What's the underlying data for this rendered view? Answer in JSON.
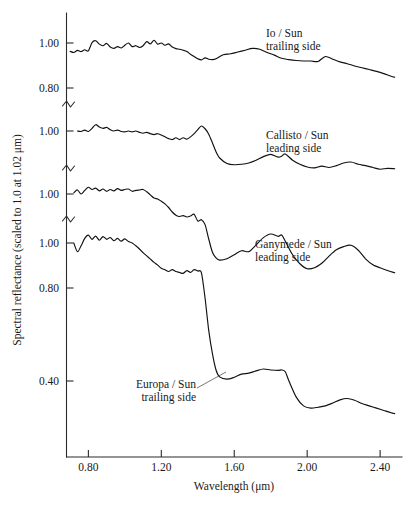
{
  "chart_data": {
    "type": "line",
    "title": "",
    "xlabel": "Wavelength (μm)",
    "ylabel": "Spectral reflectance (scaled to 1.0 at 1.02 μm)",
    "xlim": [
      0.68,
      2.52
    ],
    "xticks": [
      0.8,
      1.2,
      1.6,
      2.0,
      2.4
    ],
    "xtick_labels": [
      "0.80",
      "1.20",
      "1.60",
      "2.00",
      "2.40"
    ],
    "grid": false,
    "legend_position": "inline-annotations",
    "axis_note": "Broken y-axis: each spectrum is plotted on its own offset reflectance scale, each scaled to 1.0 at 1.02 micrometres. Axis breaks are drawn as zigzag marks between panels.",
    "ytick_labels": [
      "1.00",
      "0.80",
      "1.00",
      "1.00",
      "1.00",
      "0.80",
      "0.40"
    ],
    "axis_breaks": 3,
    "series": [
      {
        "name": "Io / Sun trailing side",
        "label_line1": "Io / Sun",
        "label_line2": "trailing side",
        "panel": 1,
        "yticks": [
          1.0,
          0.8
        ],
        "x": [
          0.7,
          0.72,
          0.74,
          0.76,
          0.78,
          0.8,
          0.82,
          0.84,
          0.86,
          0.88,
          0.9,
          0.92,
          0.94,
          0.96,
          0.98,
          1.0,
          1.02,
          1.04,
          1.06,
          1.08,
          1.1,
          1.12,
          1.14,
          1.16,
          1.18,
          1.2,
          1.22,
          1.24,
          1.26,
          1.28,
          1.3,
          1.32,
          1.34,
          1.36,
          1.38,
          1.4,
          1.42,
          1.44,
          1.46,
          1.48,
          1.5,
          1.54,
          1.58,
          1.62,
          1.66,
          1.7,
          1.74,
          1.78,
          1.82,
          1.86,
          1.9,
          1.94,
          1.98,
          2.02,
          2.06,
          2.1,
          2.14,
          2.18,
          2.22,
          2.26,
          2.3,
          2.34,
          2.38,
          2.42,
          2.46,
          2.48
        ],
        "y": [
          0.963,
          0.958,
          0.967,
          0.962,
          0.97,
          0.965,
          1.002,
          1.01,
          0.995,
          0.988,
          0.998,
          0.982,
          0.976,
          0.984,
          0.978,
          0.99,
          1.0,
          0.984,
          0.988,
          0.98,
          0.988,
          1.006,
          0.996,
          1.012,
          0.995,
          1.0,
          0.99,
          0.996,
          0.982,
          0.975,
          0.972,
          0.968,
          0.962,
          0.95,
          0.94,
          0.93,
          0.925,
          0.934,
          0.928,
          0.926,
          0.93,
          0.948,
          0.952,
          0.96,
          0.968,
          0.976,
          0.972,
          0.958,
          0.946,
          0.932,
          0.926,
          0.922,
          0.92,
          0.92,
          0.918,
          0.94,
          0.928,
          0.916,
          0.908,
          0.898,
          0.89,
          0.882,
          0.874,
          0.864,
          0.852,
          0.848
        ]
      },
      {
        "name": "Callisto / Sun leading side",
        "label_line1": "Callisto / Sun",
        "label_line2": "leading side",
        "panel": 2,
        "yticks": [
          1.0
        ],
        "x": [
          0.74,
          0.76,
          0.78,
          0.8,
          0.82,
          0.84,
          0.86,
          0.88,
          0.9,
          0.92,
          0.94,
          0.96,
          0.98,
          1.0,
          1.02,
          1.04,
          1.06,
          1.08,
          1.1,
          1.12,
          1.14,
          1.16,
          1.18,
          1.2,
          1.22,
          1.24,
          1.26,
          1.28,
          1.3,
          1.32,
          1.34,
          1.36,
          1.38,
          1.4,
          1.42,
          1.44,
          1.46,
          1.48,
          1.5,
          1.52,
          1.56,
          1.6,
          1.64,
          1.68,
          1.72,
          1.76,
          1.8,
          1.84,
          1.86,
          1.88,
          1.92,
          1.96,
          2.0,
          2.04,
          2.08,
          2.12,
          2.16,
          2.2,
          2.24,
          2.28,
          2.32,
          2.36,
          2.4,
          2.44,
          2.48
        ],
        "y": [
          1.0,
          0.998,
          1.004,
          0.998,
          1.012,
          1.028,
          1.018,
          1.012,
          1.016,
          1.006,
          1.0,
          1.004,
          0.998,
          0.996,
          1.0,
          0.996,
          1.0,
          0.994,
          0.99,
          0.994,
          0.988,
          0.984,
          0.988,
          0.982,
          0.974,
          0.966,
          0.962,
          0.97,
          0.962,
          0.97,
          0.964,
          0.974,
          0.988,
          1.006,
          1.022,
          1.01,
          0.986,
          0.948,
          0.908,
          0.88,
          0.856,
          0.85,
          0.852,
          0.858,
          0.87,
          0.886,
          0.896,
          0.884,
          0.888,
          0.898,
          0.87,
          0.852,
          0.84,
          0.836,
          0.844,
          0.838,
          0.846,
          0.858,
          0.862,
          0.852,
          0.846,
          0.838,
          0.83,
          0.834,
          0.832
        ]
      },
      {
        "name": "Ganymede / Sun leading side",
        "label_line1": "Ganymede / Sun",
        "label_line2": "leading side",
        "panel": 3,
        "yticks": [
          1.0
        ],
        "x": [
          0.72,
          0.74,
          0.76,
          0.78,
          0.8,
          0.82,
          0.84,
          0.86,
          0.88,
          0.9,
          0.92,
          0.94,
          0.96,
          0.98,
          1.0,
          1.02,
          1.04,
          1.06,
          1.08,
          1.1,
          1.12,
          1.14,
          1.16,
          1.18,
          1.2,
          1.22,
          1.24,
          1.26,
          1.28,
          1.3,
          1.32,
          1.34,
          1.36,
          1.38,
          1.4,
          1.42,
          1.44,
          1.46,
          1.48,
          1.5,
          1.52,
          1.56,
          1.6,
          1.64,
          1.68,
          1.72,
          1.76,
          1.8,
          1.84,
          1.86,
          1.88,
          1.92,
          1.96,
          2.0,
          2.04,
          2.08,
          2.12,
          2.16,
          2.2,
          2.24,
          2.28,
          2.32,
          2.36,
          2.4,
          2.44,
          2.48
        ],
        "y": [
          1.005,
          1.018,
          1.0,
          1.016,
          1.03,
          1.02,
          1.026,
          1.014,
          1.022,
          1.012,
          1.02,
          1.014,
          1.024,
          1.016,
          1.02,
          1.022,
          1.012,
          1.016,
          1.018,
          1.02,
          1.01,
          0.996,
          0.982,
          0.978,
          0.968,
          0.956,
          0.94,
          0.92,
          0.906,
          0.9,
          0.904,
          0.898,
          0.902,
          0.91,
          0.88,
          0.886,
          0.864,
          0.8,
          0.742,
          0.716,
          0.706,
          0.712,
          0.73,
          0.748,
          0.744,
          0.774,
          0.806,
          0.822,
          0.812,
          0.818,
          0.79,
          0.73,
          0.69,
          0.668,
          0.672,
          0.692,
          0.724,
          0.752,
          0.766,
          0.772,
          0.75,
          0.712,
          0.686,
          0.672,
          0.66,
          0.65
        ]
      },
      {
        "name": "Europa / Sun trailing side",
        "label_line1": "Europa / Sun",
        "label_line2": "trailing side",
        "panel": 4,
        "yticks": [
          1.0,
          0.8,
          0.4
        ],
        "has_leader_line": true,
        "x": [
          0.72,
          0.74,
          0.76,
          0.78,
          0.8,
          0.82,
          0.84,
          0.86,
          0.88,
          0.9,
          0.92,
          0.94,
          0.96,
          0.98,
          1.0,
          1.02,
          1.04,
          1.06,
          1.08,
          1.1,
          1.12,
          1.14,
          1.16,
          1.18,
          1.2,
          1.22,
          1.24,
          1.26,
          1.28,
          1.3,
          1.32,
          1.34,
          1.36,
          1.38,
          1.4,
          1.42,
          1.44,
          1.46,
          1.48,
          1.5,
          1.52,
          1.56,
          1.6,
          1.64,
          1.68,
          1.72,
          1.76,
          1.8,
          1.84,
          1.86,
          1.88,
          1.9,
          1.94,
          1.98,
          2.02,
          2.06,
          2.1,
          2.14,
          2.18,
          2.22,
          2.26,
          2.3,
          2.34,
          2.38,
          2.42,
          2.46,
          2.48
        ],
        "y": [
          1.0,
          0.962,
          0.988,
          1.02,
          1.034,
          1.016,
          1.03,
          1.012,
          1.028,
          1.016,
          1.024,
          1.01,
          1.02,
          1.008,
          1.018,
          1.006,
          1.0,
          0.988,
          0.974,
          0.958,
          0.944,
          0.93,
          0.916,
          0.904,
          0.89,
          0.884,
          0.876,
          0.884,
          0.876,
          0.872,
          0.868,
          0.88,
          0.872,
          0.884,
          0.878,
          0.87,
          0.76,
          0.62,
          0.52,
          0.448,
          0.418,
          0.408,
          0.416,
          0.43,
          0.434,
          0.444,
          0.452,
          0.448,
          0.446,
          0.448,
          0.44,
          0.4,
          0.33,
          0.292,
          0.282,
          0.286,
          0.292,
          0.304,
          0.318,
          0.324,
          0.316,
          0.302,
          0.292,
          0.282,
          0.272,
          0.262,
          0.258
        ]
      }
    ]
  },
  "annotations": {
    "io": {
      "line1": "Io / Sun",
      "line2": "trailing side"
    },
    "callisto": {
      "line1": "Callisto / Sun",
      "line2": "leading side"
    },
    "ganymede": {
      "line1": "Ganymede / Sun",
      "line2": "leading side"
    },
    "europa": {
      "line1": "Europa / Sun",
      "line2": "trailing side"
    }
  },
  "axes": {
    "x_title": "Wavelength (μm)",
    "y_title": "Spectral reflectance (scaled to 1.0 at 1.02 μm)",
    "x_tick_labels": [
      "0.80",
      "1.20",
      "1.60",
      "2.00",
      "2.40"
    ],
    "y_tick_labels": [
      "1.00",
      "0.80",
      "1.00",
      "1.00",
      "1.00",
      "0.80",
      "0.40"
    ]
  },
  "colors": {
    "curve": "#111111",
    "axis": "#2b2b2b",
    "text": "#1a1a1a",
    "background": "#ffffff"
  }
}
